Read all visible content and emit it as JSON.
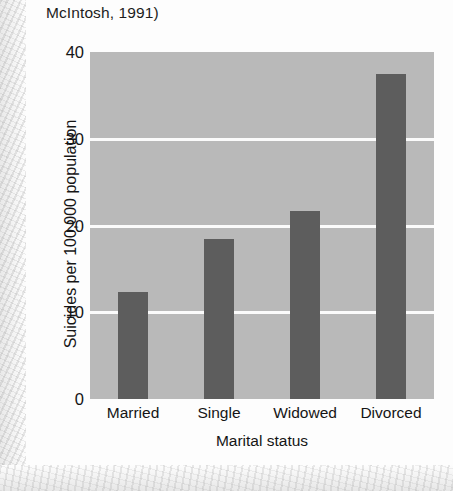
{
  "caption": "McIntosh, 1991)",
  "chart_data": {
    "type": "bar",
    "title": "",
    "categories": [
      "Married",
      "Single",
      "Widowed",
      "Divorced"
    ],
    "values": [
      12.3,
      18.5,
      21.7,
      37.5
    ],
    "xlabel": "Marital status",
    "ylabel": "Suicides per 100,000 population",
    "ylim": [
      0,
      40
    ],
    "yticks": [
      0,
      10,
      20,
      30,
      40
    ],
    "ytick_labels": [
      "0",
      "10",
      "20",
      "30",
      "40"
    ],
    "gridlines": [
      10,
      20,
      30
    ],
    "grid": true,
    "legend": "none",
    "colors": {
      "bar": "#5d5d5d",
      "plot_background": "#b9b9b9",
      "gridline": "#fbfbfb",
      "page_background": "#fdfdfd",
      "text": "#151515"
    }
  }
}
